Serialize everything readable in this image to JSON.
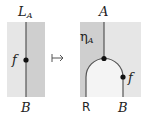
{
  "left_diagram": {
    "top_label": "L",
    "top_label_sub": "A",
    "morphism_label": "f",
    "bottom_label": "B",
    "colors": {
      "left_region": "#e6e6e6",
      "right_region": "#cfcfcf",
      "wire": "#555555"
    }
  },
  "arrow": {
    "symbol": "↦"
  },
  "right_diagram": {
    "top_label": "A",
    "unit_label": "η",
    "unit_label_sub": "A",
    "morphism_label": "f",
    "bottom_left_label": "R",
    "bottom_right_label": "B",
    "colors": {
      "outer_region": "#cfcfcf",
      "inner_region": "#f2f2f2",
      "right_region": "#e6e6e6",
      "wire": "#555555"
    }
  }
}
